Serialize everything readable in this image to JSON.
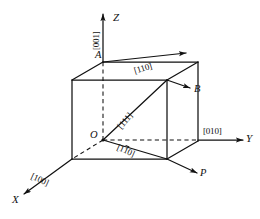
{
  "figure": {
    "type": "crystallographic-direction-diagram",
    "background_color": "#ffffff",
    "line_color": "#111111"
  },
  "axes": [
    {
      "id": "z",
      "label": "Z",
      "miller": "[001]",
      "miller_has_bar": false,
      "direction": "up"
    },
    {
      "id": "y",
      "label": "Y",
      "miller": "[010]",
      "miller_has_bar": false,
      "direction": "right"
    },
    {
      "id": "x",
      "label": "X",
      "miller": "[100]",
      "miller_has_bar": false,
      "direction": "down-left"
    }
  ],
  "points": [
    {
      "id": "origin",
      "label": "O"
    },
    {
      "id": "vertex-a",
      "label": "A"
    },
    {
      "id": "vector-b",
      "label": "B"
    },
    {
      "id": "vector-p",
      "label": "P"
    }
  ],
  "directions": [
    {
      "id": "dir-110",
      "label": "[110]",
      "bar_digits": []
    },
    {
      "id": "dir-111",
      "label": "[111]",
      "bar_digits": []
    },
    {
      "id": "dir-1bar10",
      "label_prefix": "[1",
      "label_bar": "1",
      "label_suffix": "0]",
      "bar_digits": [
        1
      ]
    }
  ],
  "labels": {
    "axis_z": "Z",
    "axis_y": "Y",
    "axis_x": "X",
    "point_o": "O",
    "point_a": "A",
    "point_b": "B",
    "point_p": "P",
    "miller_001": "[001]",
    "miller_010": "[010]",
    "miller_100": "[100]",
    "miller_110": "[110]",
    "miller_111": "[111]",
    "miller_1bar10_pre": "[1",
    "miller_1bar10_bar": "1",
    "miller_1bar10_post": "0]"
  }
}
